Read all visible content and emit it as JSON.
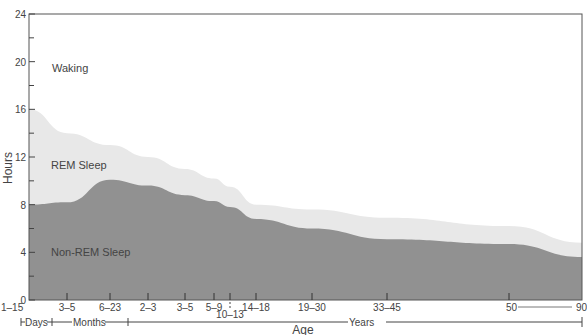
{
  "chart_data": {
    "type": "area",
    "title": "",
    "xlabel": "Age",
    "ylabel": "Hours",
    "ylim": [
      0,
      24
    ],
    "y_ticks": [
      0,
      4,
      8,
      12,
      16,
      20,
      24
    ],
    "grid": false,
    "categories": [
      "1–15",
      "3–5",
      "6–23",
      "2–3",
      "3–5",
      "5–9",
      "10–13",
      "14–18",
      "19–30",
      "33–45",
      "50",
      "90"
    ],
    "x_positions": [
      29,
      67,
      110,
      148,
      185,
      214,
      230,
      256,
      312,
      387,
      509,
      582
    ],
    "age_groups": [
      {
        "label": "Days",
        "from": "1–15",
        "to": "1–15"
      },
      {
        "label": "Months",
        "from": "3–5",
        "to": "6–23"
      },
      {
        "label": "Years",
        "from": "2–3",
        "to": "90"
      }
    ],
    "series": [
      {
        "name": "Non-REM Sleep",
        "values": [
          8.0,
          8.2,
          10.1,
          9.6,
          8.8,
          8.3,
          7.8,
          6.8,
          6.0,
          5.1,
          4.7,
          3.6
        ],
        "color": "#8f8f8f"
      },
      {
        "name": "REM Sleep",
        "values": [
          8.0,
          5.8,
          2.9,
          2.4,
          2.2,
          1.9,
          1.7,
          1.2,
          1.6,
          1.8,
          1.5,
          1.2
        ],
        "color": "#e6e6e6"
      },
      {
        "name": "Waking",
        "values": [
          8.0,
          10.0,
          11.0,
          12.0,
          13.0,
          13.8,
          14.5,
          16.0,
          16.4,
          17.1,
          17.8,
          19.2
        ],
        "color": "#ffffff"
      }
    ],
    "total_sleep": [
      16.0,
      14.0,
      13.0,
      12.0,
      11.0,
      10.2,
      9.5,
      8.0,
      7.6,
      6.9,
      6.2,
      4.8
    ],
    "region_labels": [
      "Waking",
      "REM Sleep",
      "Non-REM Sleep"
    ],
    "annotations": [
      "50——90"
    ]
  },
  "axis": {
    "y_label": "Hours",
    "x_label": "Age",
    "y_tick_labels": [
      "0",
      "4",
      "8",
      "12",
      "16",
      "20",
      "24"
    ],
    "x_tick_labels": [
      "1–15",
      "3–5",
      "6–23",
      "2–3",
      "3–5",
      "5–9",
      "10–13",
      "14–18",
      "19–30",
      "33–45",
      "50",
      "90"
    ],
    "group_labels": {
      "days": "Days",
      "months": "Months",
      "years": "Years"
    }
  },
  "labels": {
    "waking": "Waking",
    "rem": "REM Sleep",
    "nrem": "Non-REM Sleep"
  }
}
